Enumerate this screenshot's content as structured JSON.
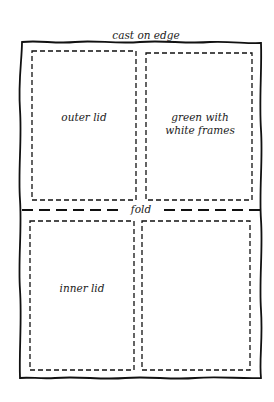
{
  "diagram": {
    "title_label": "cast on edge",
    "fold_label": "fold",
    "panels": [
      {
        "id": "top-left",
        "label": "outer lid"
      },
      {
        "id": "top-right",
        "label_line1": "green with",
        "label_line2": "white frames"
      },
      {
        "id": "bottom-left",
        "label": "inner lid"
      },
      {
        "id": "bottom-right",
        "label": ""
      }
    ],
    "colors": {
      "stroke": "#111111",
      "background": "#ffffff"
    }
  }
}
